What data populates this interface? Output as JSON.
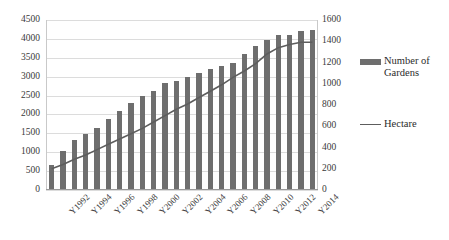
{
  "chart_data": {
    "type": "bar",
    "title": "",
    "subtitle": "",
    "xlabel": "",
    "ylabel": "",
    "grid": true,
    "legend_position": "right",
    "categories": [
      "Y1992",
      "Y1993",
      "Y1994",
      "Y1995",
      "Y1996",
      "Y1997",
      "Y1998",
      "Y1999",
      "Y2000",
      "Y2001",
      "Y2002",
      "Y2003",
      "Y2004",
      "Y2005",
      "Y2006",
      "Y2007",
      "Y2008",
      "Y2009",
      "Y2010",
      "Y2011",
      "Y2012",
      "Y2013",
      "Y2014",
      "Y2015"
    ],
    "tick_labels_shown": [
      "Y1992",
      "Y1994",
      "Y1996",
      "Y1998",
      "Y2000",
      "Y2002",
      "Y2004",
      "Y2006",
      "Y2008",
      "Y2010",
      "Y2012",
      "Y2014"
    ],
    "series": [
      {
        "name": "Number of Gardens",
        "type": "bar",
        "axis": "left",
        "color": "#6e6e6e",
        "values": [
          670,
          1020,
          1330,
          1490,
          1650,
          1890,
          2100,
          2300,
          2500,
          2620,
          2820,
          2890,
          2980,
          3110,
          3200,
          3280,
          3370,
          3600,
          3800,
          3960,
          4100,
          4100,
          4200,
          4230
        ]
      },
      {
        "name": "Hectare",
        "type": "line",
        "axis": "right",
        "color": "#5d5d5d",
        "values": [
          200,
          240,
          290,
          330,
          380,
          430,
          480,
          530,
          580,
          640,
          700,
          760,
          810,
          870,
          930,
          990,
          1060,
          1120,
          1190,
          1280,
          1340,
          1370,
          1390,
          1390
        ]
      }
    ],
    "y_left": {
      "min": 0,
      "max": 4500,
      "step": 500,
      "ticks": [
        "0",
        "500",
        "1000",
        "1500",
        "2000",
        "2500",
        "3000",
        "3500",
        "4000",
        "4500"
      ]
    },
    "y_right": {
      "min": 0,
      "max": 1600,
      "step": 200,
      "ticks": [
        "0",
        "200",
        "400",
        "600",
        "800",
        "1000",
        "1200",
        "1400",
        "1600"
      ]
    }
  },
  "legend": {
    "entries": [
      {
        "label": "Number of Gardens",
        "marker": "bar-swatch"
      },
      {
        "label": "Hectare",
        "marker": "line-swatch"
      }
    ]
  },
  "colors": {
    "bar": "#6e6e6e",
    "line": "#5d5d5d",
    "grid": "#dcdcdc",
    "axis": "#9a9a9a",
    "text": "#2b2b2b",
    "background": "#ffffff"
  }
}
